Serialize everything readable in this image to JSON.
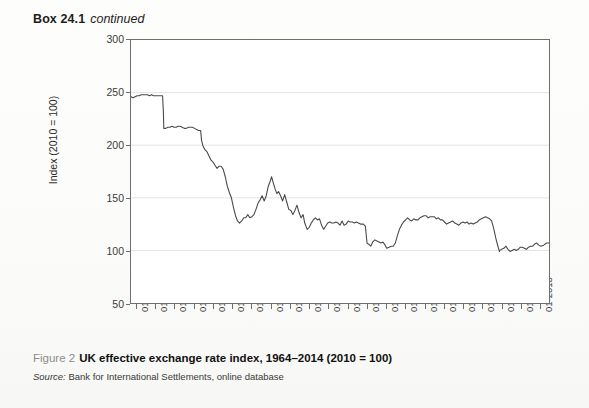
{
  "header": {
    "box_label": "Box 24.1",
    "continued_label": "continued"
  },
  "caption": {
    "figure_number": "Figure 2",
    "figure_title": "UK effective exchange rate index, 1964–2014 (2010 = 100)",
    "source_label": "Source:",
    "source_text": "Bank for International Settlements, online database"
  },
  "chart_data": {
    "type": "line",
    "title": "UK effective exchange rate index, 1964–2014 (2010 = 100)",
    "xlabel": "",
    "ylabel": "Index (2010 = 100)",
    "ylim": [
      50,
      300
    ],
    "yticks": [
      50,
      100,
      150,
      200,
      250,
      300
    ],
    "grid": true,
    "legend": "none",
    "line_color": "#4a4a4a",
    "x_tick_labels": [
      "01-1964",
      "01-1966",
      "01-1968",
      "01-1971",
      "01-1973",
      "01-1975",
      "01-1978",
      "01-1980",
      "01-1982",
      "01-1985",
      "01-1987",
      "01-1989",
      "01-1992",
      "01-1994",
      "01-1996",
      "01-1999",
      "01-2001",
      "01-2003",
      "01-2006",
      "01-2008",
      "01-2010",
      "01-2013"
    ],
    "x_start": "01-1964",
    "x_end": "12-2014",
    "series": [
      {
        "name": "UK effective exchange rate index",
        "x": [
          1964.0,
          1964.25,
          1964.5,
          1964.75,
          1965.0,
          1965.25,
          1965.5,
          1965.75,
          1966.0,
          1966.25,
          1966.5,
          1966.75,
          1967.0,
          1967.3,
          1967.6,
          1967.85,
          1967.95,
          1968.0,
          1968.25,
          1968.5,
          1968.75,
          1969.0,
          1969.25,
          1969.5,
          1969.75,
          1970.0,
          1970.25,
          1970.5,
          1970.75,
          1971.0,
          1971.25,
          1971.5,
          1971.75,
          1972.0,
          1972.25,
          1972.5,
          1972.6,
          1972.75,
          1973.0,
          1973.25,
          1973.5,
          1973.75,
          1974.0,
          1974.25,
          1974.5,
          1974.75,
          1975.0,
          1975.25,
          1975.5,
          1975.75,
          1976.0,
          1976.25,
          1976.5,
          1976.75,
          1977.0,
          1977.25,
          1977.5,
          1977.75,
          1978.0,
          1978.25,
          1978.5,
          1978.75,
          1979.0,
          1979.25,
          1979.5,
          1979.75,
          1980.0,
          1980.25,
          1980.5,
          1980.75,
          1981.0,
          1981.15,
          1981.4,
          1981.6,
          1981.8,
          1982.0,
          1982.25,
          1982.5,
          1982.75,
          1983.0,
          1983.25,
          1983.5,
          1983.75,
          1984.0,
          1984.25,
          1984.5,
          1984.75,
          1985.0,
          1985.2,
          1985.5,
          1985.75,
          1986.0,
          1986.25,
          1986.5,
          1986.75,
          1987.0,
          1987.25,
          1987.5,
          1987.75,
          1988.0,
          1988.25,
          1988.5,
          1988.75,
          1989.0,
          1989.25,
          1989.5,
          1989.75,
          1990.0,
          1990.25,
          1990.5,
          1990.75,
          1991.0,
          1991.25,
          1991.5,
          1991.75,
          1992.0,
          1992.35,
          1992.6,
          1992.72,
          1992.8,
          1992.95,
          1993.0,
          1993.25,
          1993.5,
          1993.75,
          1994.0,
          1994.25,
          1994.5,
          1994.75,
          1995.0,
          1995.2,
          1995.5,
          1995.75,
          1996.0,
          1996.25,
          1996.5,
          1996.75,
          1997.0,
          1997.25,
          1997.5,
          1997.75,
          1998.0,
          1998.25,
          1998.5,
          1998.75,
          1999.0,
          1999.25,
          1999.5,
          1999.75,
          2000.0,
          2000.25,
          2000.5,
          2000.75,
          2001.0,
          2001.25,
          2001.5,
          2001.75,
          2002.0,
          2002.25,
          2002.5,
          2002.75,
          2003.0,
          2003.25,
          2003.5,
          2003.75,
          2004.0,
          2004.25,
          2004.5,
          2004.75,
          2005.0,
          2005.25,
          2005.5,
          2005.75,
          2006.0,
          2006.25,
          2006.5,
          2006.75,
          2007.0,
          2007.25,
          2007.5,
          2007.75,
          2008.0,
          2008.25,
          2008.5,
          2008.8,
          2008.95,
          2009.0,
          2009.2,
          2009.5,
          2009.75,
          2010.0,
          2010.25,
          2010.5,
          2010.75,
          2011.0,
          2011.25,
          2011.5,
          2011.75,
          2012.0,
          2012.25,
          2012.5,
          2012.75,
          2013.0,
          2013.25,
          2013.5,
          2013.75,
          2014.0,
          2014.35,
          2014.7,
          2014.95
        ],
        "y": [
          246,
          245,
          246,
          247,
          247,
          248,
          248,
          248,
          248,
          247,
          248,
          247,
          247,
          247,
          247,
          247,
          232,
          216,
          216,
          217,
          217,
          218,
          217,
          217,
          218,
          218,
          217,
          216,
          216,
          217,
          217,
          217,
          216,
          215,
          214,
          214,
          205,
          200,
          196,
          194,
          190,
          186,
          184,
          181,
          178,
          180,
          180,
          177,
          170,
          161,
          155,
          150,
          141,
          133,
          128,
          126,
          128,
          131,
          131,
          134,
          131,
          132,
          134,
          139,
          145,
          148,
          152,
          147,
          152,
          161,
          166,
          170,
          163,
          158,
          154,
          156,
          152,
          147,
          153,
          146,
          139,
          138,
          134,
          138,
          143,
          136,
          131,
          134,
          126,
          120,
          122,
          126,
          129,
          131,
          129,
          130,
          124,
          120,
          123,
          126,
          127,
          126,
          126,
          127,
          126,
          124,
          128,
          124,
          125,
          128,
          127,
          127,
          126,
          127,
          126,
          125,
          125,
          123,
          113,
          107,
          106,
          106,
          104,
          108,
          110,
          109,
          108,
          107,
          108,
          105,
          102,
          103,
          104,
          104,
          107,
          114,
          120,
          124,
          127,
          129,
          131,
          129,
          128,
          130,
          129,
          129,
          131,
          132,
          133,
          133,
          131,
          132,
          132,
          132,
          130,
          131,
          129,
          129,
          127,
          125,
          126,
          127,
          128,
          126,
          125,
          124,
          126,
          127,
          126,
          127,
          125,
          126,
          125,
          126,
          127,
          129,
          130,
          131,
          132,
          131,
          130,
          128,
          121,
          112,
          103,
          99,
          100,
          101,
          102,
          104,
          101,
          99,
          100,
          101,
          100,
          101,
          103,
          103,
          102,
          101,
          103,
          104,
          104,
          106,
          107,
          105,
          104,
          105,
          107,
          107
        ]
      }
    ]
  }
}
